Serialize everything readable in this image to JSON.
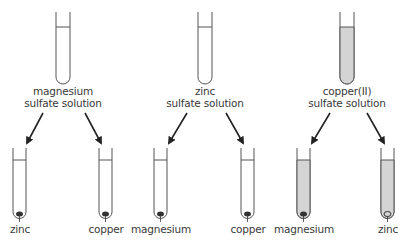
{
  "colors": {
    "outline": "#555555",
    "solution_clear": "#ffffff",
    "solution_copper": "#d4d4d4",
    "metal": "#333333",
    "arrow": "#222222",
    "text": "#3a3a3a"
  },
  "groups": [
    {
      "solution": {
        "line1": "magnesium",
        "line2": "sulfate solution",
        "colored": false
      },
      "tubes": [
        {
          "metal": "zinc"
        },
        {
          "metal": "copper"
        }
      ]
    },
    {
      "solution": {
        "line1": "zinc",
        "line2": "sulfate solution",
        "colored": false
      },
      "tubes": [
        {
          "metal": "magnesium"
        },
        {
          "metal": "copper"
        }
      ]
    },
    {
      "solution": {
        "line1": "copper(II)",
        "line2": "sulfate solution",
        "colored": true
      },
      "tubes": [
        {
          "metal": "magnesium"
        },
        {
          "metal": "zinc"
        }
      ]
    }
  ]
}
